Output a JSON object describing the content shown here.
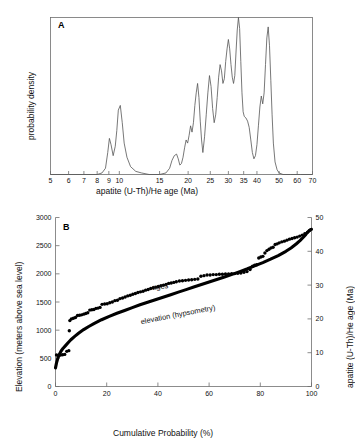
{
  "figure": {
    "background": "#ffffff",
    "panels": [
      "A",
      "B"
    ]
  },
  "panelA": {
    "letter": "A",
    "ylabel": "probability density",
    "xlabel": "apatite (U-Th)/He age (Ma)"
  },
  "panelB": {
    "letter": "B",
    "ylabel_left": "Elevation (meters above sea level)",
    "ylabel_right": "apatite (U-Th)/He age (Ma)",
    "xlabel": "Cumulative Probability (%)",
    "annotation_ages": "ages",
    "annotation_elevation": "elevation (hypsometry)"
  },
  "chart_data": [
    {
      "type": "line",
      "id": "panel-A-probability-density",
      "title": "A",
      "xlabel": "apatite (U-Th)/He age (Ma)",
      "ylabel": "probability density",
      "xscale": "log",
      "xlim": [
        5,
        70
      ],
      "ylim": [
        0,
        1
      ],
      "grid": false,
      "legend": "none",
      "xticks": [
        5,
        6,
        7,
        8,
        9,
        10,
        15,
        20,
        25,
        30,
        35,
        40,
        50,
        60,
        70
      ],
      "xtick_labels": [
        "5",
        "6",
        "7",
        "8",
        "9",
        "10",
        "15",
        "20",
        "25",
        "30",
        "35",
        "40",
        "50",
        "60",
        "70"
      ],
      "yticks": [],
      "ytick_labels": [],
      "series": [
        {
          "name": "probability density",
          "color": "#555555",
          "x": [
            5.0,
            6.0,
            7.0,
            8.0,
            8.4,
            8.7,
            8.9,
            9.05,
            9.2,
            9.4,
            9.6,
            9.75,
            9.9,
            10.1,
            10.3,
            10.5,
            10.8,
            11.2,
            11.8,
            12.5,
            13.5,
            15.0,
            16.0,
            16.6,
            17.0,
            17.4,
            17.8,
            18.1,
            18.4,
            18.7,
            19.0,
            19.3,
            19.6,
            19.9,
            20.2,
            20.5,
            20.8,
            21.1,
            21.4,
            21.7,
            22.0,
            22.3,
            22.6,
            22.9,
            23.2,
            23.6,
            24.0,
            24.4,
            24.8,
            25.2,
            25.6,
            26.0,
            26.4,
            26.8,
            27.2,
            27.6,
            28.0,
            28.4,
            28.8,
            29.2,
            29.6,
            30.0,
            30.4,
            30.8,
            31.2,
            31.6,
            32.0,
            32.4,
            32.8,
            33.2,
            33.6,
            34.0,
            34.4,
            34.8,
            35.2,
            35.8,
            36.4,
            37.0,
            37.6,
            38.2,
            38.8,
            39.4,
            40.0,
            40.6,
            41.2,
            41.8,
            42.4,
            43.0,
            43.6,
            44.2,
            44.8,
            45.4,
            46.0,
            46.6,
            47.2,
            48.0,
            49.0,
            50.0,
            52.0,
            56.0,
            62.0,
            70.0
          ],
          "y": [
            0.0,
            0.0,
            0.0,
            0.0,
            0.01,
            0.04,
            0.14,
            0.23,
            0.19,
            0.12,
            0.18,
            0.28,
            0.41,
            0.44,
            0.33,
            0.2,
            0.11,
            0.05,
            0.02,
            0.01,
            0.0,
            0.0,
            0.01,
            0.04,
            0.09,
            0.12,
            0.13,
            0.1,
            0.06,
            0.07,
            0.11,
            0.17,
            0.22,
            0.2,
            0.25,
            0.31,
            0.27,
            0.33,
            0.44,
            0.52,
            0.58,
            0.49,
            0.34,
            0.22,
            0.14,
            0.24,
            0.38,
            0.52,
            0.63,
            0.56,
            0.42,
            0.33,
            0.38,
            0.49,
            0.62,
            0.7,
            0.66,
            0.58,
            0.61,
            0.72,
            0.8,
            0.86,
            0.8,
            0.7,
            0.62,
            0.58,
            0.63,
            0.78,
            0.92,
            1.0,
            0.93,
            0.72,
            0.52,
            0.4,
            0.37,
            0.36,
            0.34,
            0.3,
            0.22,
            0.14,
            0.1,
            0.12,
            0.19,
            0.31,
            0.43,
            0.5,
            0.45,
            0.52,
            0.7,
            0.87,
            0.94,
            0.82,
            0.6,
            0.38,
            0.2,
            0.08,
            0.03,
            0.01,
            0.0,
            0.0,
            0.0,
            0.0,
            0.0,
            0.0,
            0.0
          ]
        }
      ]
    },
    {
      "type": "scatter",
      "id": "panel-B-hypsometry-and-ages",
      "title": "B",
      "xlabel": "Cumulative Probability (%)",
      "ylabel": "Elevation (meters above sea level)",
      "ylabel_secondary": "apatite (U-Th)/He age (Ma)",
      "xlim": [
        0,
        100
      ],
      "ylim": [
        0,
        3000
      ],
      "ylim_secondary": [
        0,
        50
      ],
      "grid": false,
      "legend": "inline-annotations",
      "xticks": [
        0,
        20,
        40,
        60,
        80,
        100
      ],
      "xtick_labels": [
        "0",
        "20",
        "40",
        "60",
        "80",
        "100"
      ],
      "yticks": [
        0,
        500,
        1000,
        1500,
        2000,
        2500,
        3000
      ],
      "ytick_labels": [
        "0",
        "500",
        "1000",
        "1500",
        "2000",
        "2500",
        "3000"
      ],
      "yticks_secondary": [
        0,
        10,
        20,
        30,
        40,
        50
      ],
      "ytick_labels_secondary": [
        "0",
        "10",
        "20",
        "30",
        "40",
        "50"
      ],
      "series": [
        {
          "name": "elevation (hypsometry)",
          "axis": "left",
          "style": "thick-line",
          "color": "#000000",
          "x": [
            0.0,
            0.4,
            0.9,
            1.5,
            2.2,
            3.0,
            4.0,
            5.0,
            6.0,
            7.5,
            9.0,
            11.0,
            13.0,
            15.0,
            18.0,
            21.0,
            24.0,
            27.0,
            30.0,
            33.0,
            36.0,
            39.0,
            42.0,
            45.0,
            48.0,
            51.0,
            54.0,
            57.0,
            60.0,
            63.0,
            66.0,
            69.0,
            72.0,
            75.0,
            78.0,
            81.0,
            84.0,
            87.0,
            90.0,
            92.0,
            94.0,
            95.5,
            96.8,
            97.8,
            98.5,
            99.1,
            99.5,
            99.8,
            100.0
          ],
          "y": [
            330,
            420,
            500,
            570,
            630,
            680,
            730,
            780,
            830,
            890,
            945,
            1010,
            1065,
            1115,
            1185,
            1245,
            1300,
            1350,
            1400,
            1450,
            1495,
            1540,
            1585,
            1630,
            1675,
            1720,
            1765,
            1810,
            1855,
            1900,
            1945,
            1990,
            2040,
            2090,
            2145,
            2200,
            2260,
            2325,
            2400,
            2460,
            2530,
            2590,
            2650,
            2700,
            2740,
            2765,
            2780,
            2788,
            2790
          ]
        },
        {
          "name": "ages",
          "axis": "right",
          "style": "markers",
          "color": "#000000",
          "x": [
            0.4,
            1.2,
            2.0,
            2.8,
            3.6,
            4.4,
            5.2,
            5.4,
            5.6,
            6.2,
            7.0,
            7.8,
            8.6,
            9.4,
            10.2,
            11.0,
            11.8,
            12.6,
            13.4,
            14.2,
            15.0,
            15.8,
            16.6,
            17.4,
            18.2,
            19.2,
            20.2,
            21.2,
            22.2,
            23.2,
            24.2,
            25.2,
            26.2,
            27.2,
            28.2,
            29.2,
            30.2,
            31.2,
            32.2,
            33.2,
            34.2,
            35.2,
            36.2,
            37.2,
            38.2,
            39.2,
            40.2,
            41.2,
            42.2,
            43.2,
            44.2,
            45.2,
            46.2,
            47.2,
            48.4,
            49.6,
            50.8,
            52.0,
            53.2,
            54.4,
            55.6,
            56.8,
            58.0,
            59.2,
            60.4,
            61.6,
            62.8,
            64.0,
            65.2,
            66.4,
            67.6,
            68.8,
            70.0,
            71.2,
            72.4,
            73.6,
            74.8,
            76.0,
            77.0,
            77.8,
            78.6,
            79.4,
            80.2,
            81.0,
            81.8,
            82.6,
            83.4,
            84.2,
            85.0,
            85.8,
            86.6,
            87.4,
            88.4,
            89.4,
            90.4,
            91.4,
            92.4,
            93.4,
            94.4,
            95.4,
            96.4,
            97.4,
            98.4,
            99.3
          ],
          "y": [
            9.3,
            9.2,
            9.3,
            9.4,
            9.5,
            10.4,
            10.6,
            16.5,
            19.5,
            20.0,
            20.2,
            20.4,
            21.0,
            21.1,
            21.2,
            21.4,
            21.6,
            21.8,
            22.6,
            22.7,
            22.8,
            23.1,
            23.2,
            23.4,
            24.3,
            24.4,
            24.5,
            24.8,
            25.0,
            25.4,
            25.5,
            26.0,
            26.2,
            26.5,
            26.8,
            27.0,
            27.3,
            27.5,
            27.8,
            28.0,
            28.2,
            28.5,
            28.7,
            29.0,
            29.2,
            29.4,
            29.6,
            29.8,
            30.0,
            30.2,
            30.5,
            30.6,
            30.8,
            31.0,
            31.2,
            31.3,
            31.4,
            31.5,
            31.6,
            31.7,
            31.8,
            32.6,
            32.8,
            33.0,
            33.0,
            33.1,
            33.1,
            33.2,
            33.2,
            33.3,
            33.3,
            33.4,
            33.4,
            33.5,
            33.6,
            33.8,
            34.0,
            34.6,
            35.6,
            35.9,
            36.0,
            38.0,
            38.3,
            38.5,
            39.5,
            40.2,
            40.6,
            41.0,
            41.2,
            42.0,
            42.2,
            42.5,
            42.8,
            43.0,
            43.3,
            43.6,
            43.8,
            44.0,
            44.2,
            44.5,
            44.8,
            45.2,
            45.6,
            46.2
          ]
        }
      ]
    }
  ]
}
